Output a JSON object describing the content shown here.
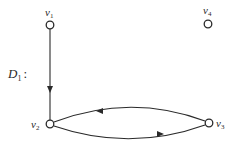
{
  "graph": {
    "name": "D",
    "name_subscript": "1",
    "name_suffix": ":",
    "colors": {
      "stroke": "#2a2a2a",
      "background": "#ffffff",
      "node_fill": "#ffffff"
    },
    "vertices": [
      {
        "id": "v1",
        "label": "v",
        "subscript": "1",
        "x": 50,
        "y": 25
      },
      {
        "id": "v2",
        "label": "v",
        "subscript": "2",
        "x": 50,
        "y": 124
      },
      {
        "id": "v3",
        "label": "v",
        "subscript": "3",
        "x": 209,
        "y": 123
      },
      {
        "id": "v4",
        "label": "v",
        "subscript": "4",
        "x": 208,
        "y": 24
      }
    ],
    "edges": [
      {
        "from": "v1",
        "to": "v2",
        "type": "straight",
        "directed": true
      },
      {
        "from": "v3",
        "to": "v2",
        "type": "arc-upper",
        "directed": true
      },
      {
        "from": "v2",
        "to": "v3",
        "type": "arc-lower",
        "directed": true
      }
    ]
  }
}
